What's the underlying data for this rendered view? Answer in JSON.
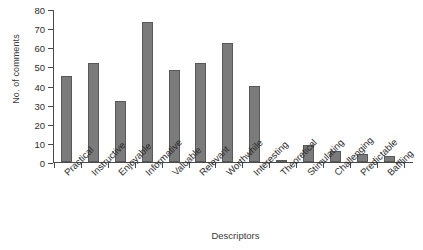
{
  "chart_data": {
    "type": "bar",
    "title": "",
    "xlabel": "Descriptors",
    "ylabel": "No. of comments",
    "ylim": [
      0,
      80
    ],
    "yticks": [
      0,
      10,
      20,
      30,
      40,
      50,
      60,
      70,
      80
    ],
    "grid": false,
    "legend": null,
    "bar_color": "#7b7b7b",
    "bar_edge_color": "#595959",
    "axis_color": "#4a4a4a",
    "categories": [
      "Practical",
      "Instructive",
      "Enjoyable",
      "Informative",
      "Valuable",
      "Relevant",
      "Worthwhile",
      "Interesting",
      "Theoretical",
      "Stimulating",
      "Challenging",
      "Predictable",
      "Baffling"
    ],
    "values": [
      45,
      52,
      32,
      73,
      48,
      52,
      62,
      40,
      1,
      9,
      6,
      4,
      3
    ]
  }
}
